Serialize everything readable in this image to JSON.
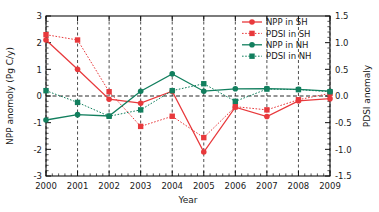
{
  "chart_data": {
    "type": "line",
    "title": "",
    "xlabel": "Year",
    "ylabel": "NPP anomoly (Pg C/y)",
    "y2label": "PDSI anomaly",
    "x": [
      2000,
      2001,
      2002,
      2003,
      2004,
      2005,
      2006,
      2007,
      2008,
      2009
    ],
    "categories": [
      "2000",
      "2001",
      "2002",
      "2003",
      "2004",
      "2005",
      "2006",
      "2007",
      "2008",
      "2009"
    ],
    "xlim": [
      2000,
      2009
    ],
    "ylim": [
      -3,
      3
    ],
    "y2lim": [
      -1.5,
      1.5
    ],
    "yticks": [
      "3",
      "2",
      "1",
      "0",
      "-1",
      "-2",
      "-3"
    ],
    "ytick_values": [
      3,
      2,
      1,
      0,
      -1,
      -2,
      -3
    ],
    "y2ticks": [
      "1.5",
      "1.0",
      "0.5",
      "0.0",
      "-0.5",
      "-1.0",
      "-1.5"
    ],
    "y2tick_values": [
      1.5,
      1.0,
      0.5,
      0.0,
      -0.5,
      -1.0,
      -1.5
    ],
    "xticks": [
      "2000",
      "2001",
      "2002",
      "2003",
      "2004",
      "2005",
      "2006",
      "2007",
      "2008",
      "2009"
    ],
    "grid": "vertical dashed gridlines at each year; horizontal dashed zero line",
    "legend_position": "top-right",
    "series": [
      {
        "name": "NPP in SH",
        "axis": "left",
        "color": "#e8393c",
        "style": "solid",
        "marker": "circle",
        "values": [
          2.1,
          1.0,
          -0.12,
          -0.27,
          0.18,
          -2.1,
          -0.42,
          -0.77,
          -0.18,
          -0.1
        ]
      },
      {
        "name": "PDSI in SH",
        "axis": "right",
        "color": "#e8393c",
        "style": "dotted",
        "marker": "square",
        "values": [
          1.15,
          1.05,
          0.08,
          -0.57,
          -0.38,
          -0.78,
          -0.2,
          -0.26,
          -0.07,
          0.05
        ]
      },
      {
        "name": "NPP in NH",
        "axis": "left",
        "color": "#127f5e",
        "style": "solid",
        "marker": "circle",
        "values": [
          -0.9,
          -0.7,
          -0.75,
          0.18,
          0.83,
          0.18,
          0.27,
          0.28,
          0.25,
          0.18
        ]
      },
      {
        "name": "PDSI in NH",
        "axis": "right",
        "color": "#127f5e",
        "style": "dotted",
        "marker": "square",
        "values": [
          0.1,
          -0.12,
          -0.38,
          -0.26,
          0.1,
          0.23,
          -0.1,
          0.13,
          0.12,
          0.08
        ]
      }
    ]
  },
  "legend": {
    "items": [
      {
        "label": "NPP in SH"
      },
      {
        "label": "PDSI in SH"
      },
      {
        "label": "NPP in NH"
      },
      {
        "label": "PDSI in NH"
      }
    ]
  },
  "colors": {
    "red": "#e8393c",
    "green": "#127f5e",
    "axis": "#1a1a1a",
    "background": "#ffffff"
  }
}
